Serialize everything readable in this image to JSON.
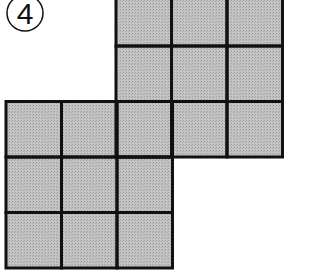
{
  "problem": {
    "number": "4",
    "number_style": "circled"
  },
  "figure": {
    "cell_fill": "#bdbdbd",
    "line_color": "#111111",
    "cell_size_px": 55.5,
    "grids": [
      {
        "name": "upper-right-grid",
        "rows": 3,
        "cols": 3,
        "x": 116,
        "y": -9.5
      },
      {
        "name": "lower-left-grid",
        "rows": 3,
        "cols": 3,
        "x": 6,
        "y": 101.5
      }
    ],
    "overlap_cells": 1,
    "total_unique_cells": 17
  }
}
